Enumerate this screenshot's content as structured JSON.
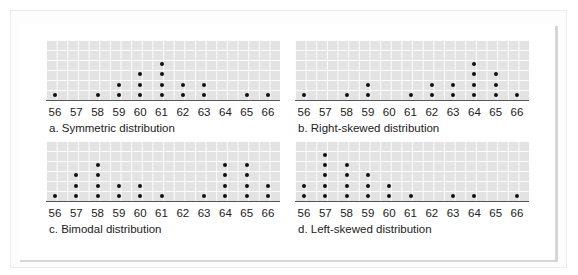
{
  "chart_data": [
    {
      "type": "scatter",
      "subtype": "dot_plot",
      "title": "a. Symmetric distribution",
      "x": [
        56,
        57,
        58,
        59,
        60,
        61,
        62,
        63,
        64,
        65,
        66
      ],
      "values": [
        1,
        0,
        1,
        2,
        3,
        4,
        2,
        2,
        0,
        1,
        1
      ],
      "xlabel": "",
      "ylabel": "",
      "grid": true
    },
    {
      "type": "scatter",
      "subtype": "dot_plot",
      "title": "b. Right-skewed distribution",
      "x": [
        56,
        57,
        58,
        59,
        60,
        61,
        62,
        63,
        64,
        65,
        66
      ],
      "values": [
        1,
        0,
        1,
        2,
        0,
        1,
        2,
        2,
        4,
        3,
        1
      ],
      "xlabel": "",
      "ylabel": "",
      "grid": true
    },
    {
      "type": "scatter",
      "subtype": "dot_plot",
      "title": "c. Bimodal distribution",
      "x": [
        56,
        57,
        58,
        59,
        60,
        61,
        62,
        63,
        64,
        65,
        66
      ],
      "values": [
        1,
        3,
        4,
        2,
        2,
        1,
        0,
        1,
        4,
        4,
        2
      ],
      "xlabel": "",
      "ylabel": "",
      "grid": true
    },
    {
      "type": "scatter",
      "subtype": "dot_plot",
      "title": "d. Left-skewed distribution",
      "x": [
        56,
        57,
        58,
        59,
        60,
        61,
        62,
        63,
        64,
        65,
        66
      ],
      "values": [
        2,
        5,
        4,
        3,
        2,
        1,
        0,
        1,
        1,
        0,
        1
      ],
      "xlabel": "",
      "ylabel": "",
      "grid": true
    }
  ],
  "plots": [
    {
      "caption": "a. Symmetric distribution",
      "left": 46,
      "top": 40
    },
    {
      "caption": "b. Right-skewed distribution",
      "left": 295,
      "top": 40
    },
    {
      "caption": "c. Bimodal distribution",
      "left": 46,
      "top": 141
    },
    {
      "caption": "d. Left-skewed distribution",
      "left": 295,
      "top": 141
    }
  ],
  "colors": {
    "grid_fill": "#e3e3e3",
    "dot": "#111111",
    "axis": "#555555",
    "text": "#222222"
  }
}
